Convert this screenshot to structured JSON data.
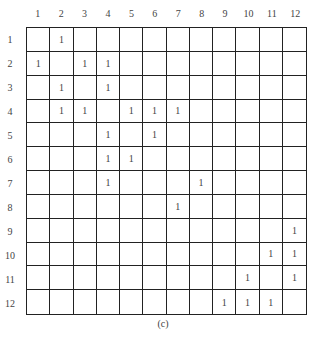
{
  "column_labels": [
    "1",
    "2",
    "3",
    "4",
    "5",
    "6",
    "7",
    "8",
    "9",
    "10",
    "11",
    "12"
  ],
  "row_labels": [
    "1",
    "2",
    "3",
    "4",
    "5",
    "6",
    "7",
    "8",
    "9",
    "10",
    "11",
    "12"
  ],
  "matrix": [
    [
      "",
      "1",
      "",
      "",
      "",
      "",
      "",
      "",
      "",
      "",
      "",
      ""
    ],
    [
      "1",
      "",
      "1",
      "1",
      "",
      "",
      "",
      "",
      "",
      "",
      "",
      ""
    ],
    [
      "",
      "1",
      "",
      "1",
      "",
      "",
      "",
      "",
      "",
      "",
      "",
      ""
    ],
    [
      "",
      "1",
      "1",
      "",
      "1",
      "1",
      "1",
      "",
      "",
      "",
      "",
      ""
    ],
    [
      "",
      "",
      "",
      "1",
      "",
      "1",
      "",
      "",
      "",
      "",
      "",
      ""
    ],
    [
      "",
      "",
      "",
      "1",
      "1",
      "",
      "",
      "",
      "",
      "",
      "",
      ""
    ],
    [
      "",
      "",
      "",
      "1",
      "",
      "",
      "",
      "1",
      "",
      "",
      "",
      ""
    ],
    [
      "",
      "",
      "",
      "",
      "",
      "",
      "1",
      "",
      "",
      "",
      "",
      ""
    ],
    [
      "",
      "",
      "",
      "",
      "",
      "",
      "",
      "",
      "",
      "",
      "",
      "1"
    ],
    [
      "",
      "",
      "",
      "",
      "",
      "",
      "",
      "",
      "",
      "",
      "1",
      "1"
    ],
    [
      "",
      "",
      "",
      "",
      "",
      "",
      "",
      "",
      "",
      "1",
      "",
      "1"
    ],
    [
      "",
      "",
      "",
      "",
      "",
      "",
      "",
      "",
      "1",
      "1",
      "1",
      ""
    ]
  ],
  "caption": "(c)"
}
